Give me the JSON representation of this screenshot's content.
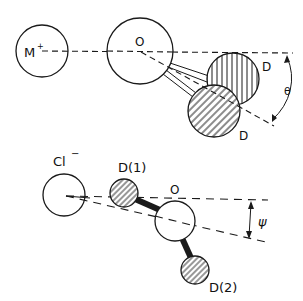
{
  "top_diagram": {
    "labels": {
      "cation": "M",
      "cation_charge": "+",
      "oxygen": "O",
      "deuterium_a": "D",
      "deuterium_b": "D",
      "angle": "θ"
    }
  },
  "bottom_diagram": {
    "labels": {
      "anion": "Cl",
      "anion_charge": "−",
      "deuterium_1": "D(1)",
      "oxygen": "O",
      "deuterium_2": "D(2)",
      "angle": "ψ"
    }
  },
  "colors": {
    "ink": "#1a1a1a",
    "background": "#ffffff"
  }
}
